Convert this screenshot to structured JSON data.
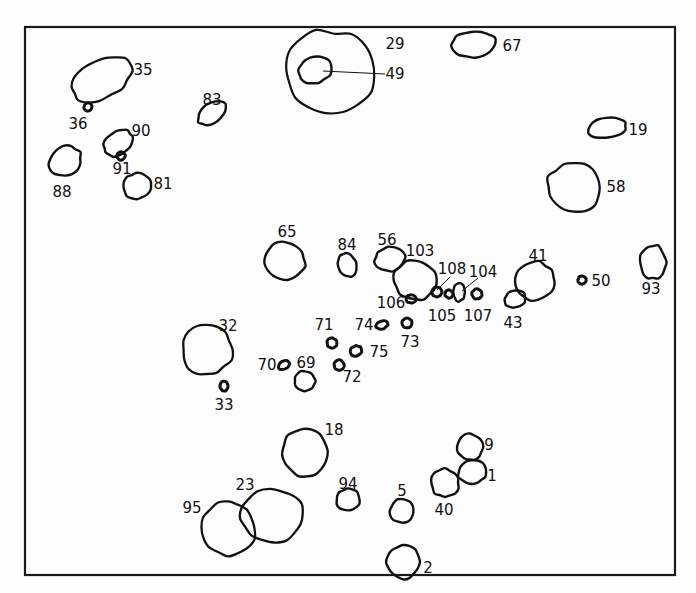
{
  "figure": {
    "kind": "scientific-figure-outline-map",
    "frame": {
      "x": 25,
      "y": 27,
      "width": 650,
      "height": 548,
      "stroke_color": "#1a1a1a",
      "stroke_width": 2.2
    },
    "canvas": {
      "width": 696,
      "height": 593,
      "background_color": "#fdfdfd",
      "outline_color": "#111111"
    }
  },
  "chart_data": {
    "type": "scatter",
    "xlabel": "",
    "ylabel": "",
    "xlim": [
      25,
      675
    ],
    "ylim": [
      27,
      575
    ],
    "grid": false,
    "legend": "none",
    "count": 44,
    "labels": [
      "35",
      "36",
      "90",
      "91",
      "88",
      "81",
      "83",
      "29",
      "49",
      "67",
      "19",
      "58",
      "65",
      "84",
      "56",
      "103",
      "106",
      "108",
      "105",
      "104",
      "107",
      "41",
      "43",
      "50",
      "93",
      "32",
      "33",
      "71",
      "74",
      "73",
      "75",
      "70",
      "69",
      "72",
      "18",
      "9",
      "1",
      "23",
      "95",
      "94",
      "5",
      "40",
      "2"
    ],
    "points": [
      {
        "label": "35",
        "cx": 102,
        "cy": 79,
        "rx": 33,
        "ry": 19,
        "rot": -28,
        "size": "large",
        "label_x": 143,
        "label_y": 70
      },
      {
        "label": "36",
        "cx": 88,
        "cy": 107,
        "rx": 4,
        "ry": 4,
        "rot": 0,
        "size": "dot",
        "label_x": 78,
        "label_y": 124
      },
      {
        "label": "90",
        "cx": 118,
        "cy": 143,
        "rx": 16,
        "ry": 11,
        "rot": -38,
        "size": "small",
        "label_x": 141,
        "label_y": 131
      },
      {
        "label": "91",
        "cx": 121,
        "cy": 156,
        "rx": 4,
        "ry": 4,
        "rot": 0,
        "size": "dot",
        "label_x": 122,
        "label_y": 169
      },
      {
        "label": "88",
        "cx": 65,
        "cy": 161,
        "rx": 17,
        "ry": 14,
        "rot": -30,
        "size": "small",
        "label_x": 62,
        "label_y": 192
      },
      {
        "label": "81",
        "cx": 137,
        "cy": 186,
        "rx": 14,
        "ry": 13,
        "rot": -25,
        "size": "small",
        "label_x": 163,
        "label_y": 184
      },
      {
        "label": "83",
        "cx": 212,
        "cy": 113,
        "rx": 16,
        "ry": 10,
        "rot": -35,
        "size": "small",
        "label_x": 212,
        "label_y": 100
      },
      {
        "label": "29",
        "cx": 330,
        "cy": 72,
        "rx": 44,
        "ry": 41,
        "rot": 6,
        "size": "xlarge",
        "label_x": 395,
        "label_y": 44
      },
      {
        "label": "49",
        "cx": 315,
        "cy": 70,
        "rx": 17,
        "ry": 13,
        "rot": -18,
        "size": "small",
        "label_x": 395,
        "label_y": 74
      },
      {
        "label": "67",
        "cx": 474,
        "cy": 44,
        "rx": 22,
        "ry": 13,
        "rot": -4,
        "size": "medium",
        "label_x": 512,
        "label_y": 46
      },
      {
        "label": "19",
        "cx": 607,
        "cy": 128,
        "rx": 19,
        "ry": 10,
        "rot": -6,
        "size": "small",
        "label_x": 638,
        "label_y": 130
      },
      {
        "label": "58",
        "cx": 574,
        "cy": 187,
        "rx": 27,
        "ry": 25,
        "rot": 0,
        "size": "large",
        "label_x": 616,
        "label_y": 187
      },
      {
        "label": "65",
        "cx": 285,
        "cy": 261,
        "rx": 20,
        "ry": 19,
        "rot": -8,
        "size": "medium",
        "label_x": 287,
        "label_y": 232
      },
      {
        "label": "84",
        "cx": 347,
        "cy": 265,
        "rx": 9,
        "ry": 12,
        "rot": -20,
        "size": "small",
        "label_x": 347,
        "label_y": 245
      },
      {
        "label": "56",
        "cx": 390,
        "cy": 259,
        "rx": 15,
        "ry": 12,
        "rot": -10,
        "size": "small",
        "label_x": 387,
        "label_y": 240
      },
      {
        "label": "103",
        "cx": 415,
        "cy": 280,
        "rx": 21,
        "ry": 20,
        "rot": 0,
        "size": "medium",
        "label_x": 420,
        "label_y": 251
      },
      {
        "label": "106",
        "cx": 411,
        "cy": 299,
        "rx": 5,
        "ry": 4,
        "rot": 0,
        "size": "dot",
        "label_x": 391,
        "label_y": 303
      },
      {
        "label": "108",
        "cx": 437,
        "cy": 292,
        "rx": 5,
        "ry": 5,
        "rot": 0,
        "size": "dot",
        "label_x": 452,
        "label_y": 269
      },
      {
        "label": "105",
        "cx": 449,
        "cy": 294,
        "rx": 4,
        "ry": 4,
        "rot": 0,
        "size": "dot",
        "label_x": 442,
        "label_y": 316
      },
      {
        "label": "104",
        "cx": 459,
        "cy": 292,
        "rx": 6,
        "ry": 9,
        "rot": 0,
        "size": "small",
        "label_x": 483,
        "label_y": 272
      },
      {
        "label": "107",
        "cx": 477,
        "cy": 294,
        "rx": 5,
        "ry": 5,
        "rot": 0,
        "size": "dot",
        "label_x": 478,
        "label_y": 316
      },
      {
        "label": "41",
        "cx": 535,
        "cy": 281,
        "rx": 20,
        "ry": 19,
        "rot": -12,
        "size": "medium",
        "label_x": 538,
        "label_y": 256
      },
      {
        "label": "43",
        "cx": 515,
        "cy": 299,
        "rx": 11,
        "ry": 8,
        "rot": -16,
        "size": "small",
        "label_x": 513,
        "label_y": 323
      },
      {
        "label": "50",
        "cx": 582,
        "cy": 280,
        "rx": 4,
        "ry": 4,
        "rot": 0,
        "size": "dot",
        "label_x": 601,
        "label_y": 281
      },
      {
        "label": "93",
        "cx": 653,
        "cy": 262,
        "rx": 13,
        "ry": 17,
        "rot": 0,
        "size": "small",
        "label_x": 651,
        "label_y": 289
      },
      {
        "label": "32",
        "cx": 207,
        "cy": 350,
        "rx": 25,
        "ry": 25,
        "rot": 0,
        "size": "large",
        "label_x": 228,
        "label_y": 326
      },
      {
        "label": "33",
        "cx": 224,
        "cy": 386,
        "rx": 4,
        "ry": 5,
        "rot": 0,
        "size": "dot",
        "label_x": 224,
        "label_y": 405
      },
      {
        "label": "71",
        "cx": 332,
        "cy": 343,
        "rx": 5,
        "ry": 5,
        "rot": -20,
        "size": "dot",
        "label_x": 324,
        "label_y": 325
      },
      {
        "label": "74",
        "cx": 382,
        "cy": 325,
        "rx": 6,
        "ry": 4,
        "rot": -18,
        "size": "dot",
        "label_x": 364,
        "label_y": 325
      },
      {
        "label": "73",
        "cx": 407,
        "cy": 323,
        "rx": 5,
        "ry": 5,
        "rot": 0,
        "size": "dot",
        "label_x": 410,
        "label_y": 342
      },
      {
        "label": "75",
        "cx": 356,
        "cy": 351,
        "rx": 6,
        "ry": 5,
        "rot": -25,
        "size": "dot",
        "label_x": 379,
        "label_y": 352
      },
      {
        "label": "70",
        "cx": 284,
        "cy": 365,
        "rx": 6,
        "ry": 4,
        "rot": -28,
        "size": "dot",
        "label_x": 267,
        "label_y": 365
      },
      {
        "label": "69",
        "cx": 305,
        "cy": 381,
        "rx": 10,
        "ry": 10,
        "rot": 0,
        "size": "small",
        "label_x": 306,
        "label_y": 363
      },
      {
        "label": "72",
        "cx": 339,
        "cy": 365,
        "rx": 5,
        "ry": 5,
        "rot": 0,
        "size": "dot",
        "label_x": 352,
        "label_y": 377
      },
      {
        "label": "18",
        "cx": 305,
        "cy": 453,
        "rx": 22,
        "ry": 25,
        "rot": -4,
        "size": "medium",
        "label_x": 334,
        "label_y": 430
      },
      {
        "label": "9",
        "cx": 470,
        "cy": 447,
        "rx": 13,
        "ry": 13,
        "rot": 0,
        "size": "small",
        "label_x": 489,
        "label_y": 445
      },
      {
        "label": "1",
        "cx": 472,
        "cy": 472,
        "rx": 14,
        "ry": 12,
        "rot": 0,
        "size": "small",
        "label_x": 492,
        "label_y": 476
      },
      {
        "label": "23",
        "cx": 272,
        "cy": 516,
        "rx": 31,
        "ry": 26,
        "rot": -4,
        "size": "large",
        "label_x": 245,
        "label_y": 485
      },
      {
        "label": "95",
        "cx": 228,
        "cy": 528,
        "rx": 27,
        "ry": 27,
        "rot": 0,
        "size": "large",
        "label_x": 192,
        "label_y": 508
      },
      {
        "label": "94",
        "cx": 348,
        "cy": 500,
        "rx": 12,
        "ry": 11,
        "rot": 0,
        "size": "small",
        "label_x": 348,
        "label_y": 484
      },
      {
        "label": "5",
        "cx": 402,
        "cy": 511,
        "rx": 12,
        "ry": 12,
        "rot": 0,
        "size": "small",
        "label_x": 402,
        "label_y": 491
      },
      {
        "label": "40",
        "cx": 445,
        "cy": 483,
        "rx": 14,
        "ry": 14,
        "rot": 0,
        "size": "small",
        "label_x": 444,
        "label_y": 510
      },
      {
        "label": "2",
        "cx": 403,
        "cy": 562,
        "rx": 16,
        "ry": 17,
        "rot": 0,
        "size": "small",
        "label_x": 428,
        "label_y": 568
      }
    ],
    "leaders": [
      {
        "label": "49",
        "from_x": 385,
        "from_y": 74,
        "to_x": 323,
        "to_y": 71
      },
      {
        "label": "108",
        "from_x": 450,
        "from_y": 277,
        "to_x": 437,
        "to_y": 290
      },
      {
        "label": "104",
        "from_x": 478,
        "from_y": 278,
        "to_x": 462,
        "to_y": 291
      }
    ]
  }
}
